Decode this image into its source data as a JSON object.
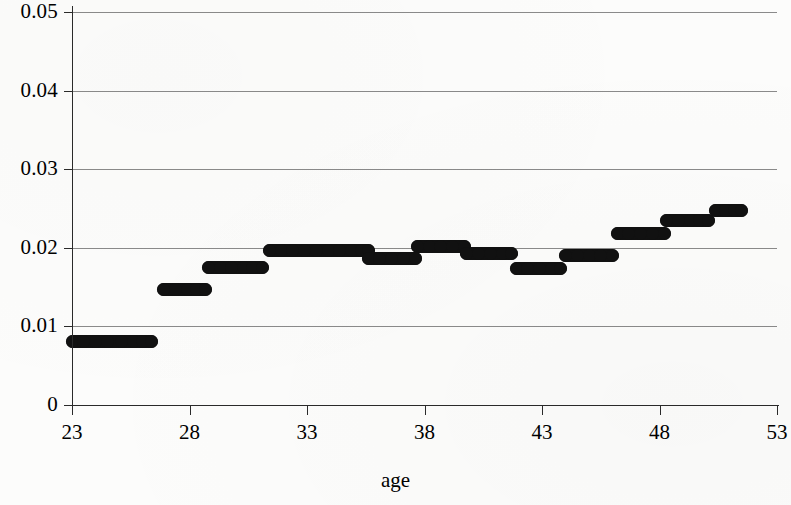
{
  "chart_data": {
    "type": "scatter",
    "title": "",
    "xlabel": "age",
    "ylabel": "",
    "xlim": [
      23,
      53
    ],
    "ylim": [
      0,
      0.05
    ],
    "grid": true,
    "legend": "none",
    "x_ticks": [
      "23",
      "28",
      "33",
      "38",
      "43",
      "48",
      "53"
    ],
    "x_tick_values": [
      23,
      28,
      33,
      38,
      43,
      48,
      53
    ],
    "y_ticks": [
      "0.05",
      "0.04",
      "0.03",
      "0.02",
      "0.01",
      "0"
    ],
    "y_tick_values": [
      0.05,
      0.04,
      0.03,
      0.02,
      0.01,
      0
    ],
    "steps": [
      {
        "x_start": 23.0,
        "x_end": 26.4,
        "value": 0.0081
      },
      {
        "x_start": 26.9,
        "x_end": 28.7,
        "value": 0.0147
      },
      {
        "x_start": 28.8,
        "x_end": 31.1,
        "value": 0.0175
      },
      {
        "x_start": 31.4,
        "x_end": 35.6,
        "value": 0.0197
      },
      {
        "x_start": 35.6,
        "x_end": 37.6,
        "value": 0.0187
      },
      {
        "x_start": 37.7,
        "x_end": 39.7,
        "value": 0.0202
      },
      {
        "x_start": 39.8,
        "x_end": 41.7,
        "value": 0.0193
      },
      {
        "x_start": 41.9,
        "x_end": 43.8,
        "value": 0.0174
      },
      {
        "x_start": 44.0,
        "x_end": 46.0,
        "value": 0.019
      },
      {
        "x_start": 46.2,
        "x_end": 48.2,
        "value": 0.0218
      },
      {
        "x_start": 48.3,
        "x_end": 50.1,
        "value": 0.0235
      },
      {
        "x_start": 50.4,
        "x_end": 51.5,
        "value": 0.0247
      }
    ],
    "points": [
      {
        "x": 23.0,
        "y": 0.0081
      },
      {
        "x": 23.5,
        "y": 0.0081
      },
      {
        "x": 24.0,
        "y": 0.0081
      },
      {
        "x": 24.5,
        "y": 0.0081
      },
      {
        "x": 25.1,
        "y": 0.0081
      },
      {
        "x": 25.6,
        "y": 0.0081
      },
      {
        "x": 26.0,
        "y": 0.0081
      },
      {
        "x": 26.4,
        "y": 0.0081
      },
      {
        "x": 26.9,
        "y": 0.0147
      },
      {
        "x": 27.4,
        "y": 0.0147
      },
      {
        "x": 27.9,
        "y": 0.0147
      },
      {
        "x": 28.3,
        "y": 0.0147
      },
      {
        "x": 28.7,
        "y": 0.0147
      },
      {
        "x": 28.8,
        "y": 0.0175
      },
      {
        "x": 29.3,
        "y": 0.0175
      },
      {
        "x": 29.8,
        "y": 0.0175
      },
      {
        "x": 30.3,
        "y": 0.0175
      },
      {
        "x": 30.7,
        "y": 0.0175
      },
      {
        "x": 31.1,
        "y": 0.0175
      },
      {
        "x": 31.4,
        "y": 0.0197
      },
      {
        "x": 31.9,
        "y": 0.0197
      },
      {
        "x": 32.4,
        "y": 0.0197
      },
      {
        "x": 32.9,
        "y": 0.0197
      },
      {
        "x": 33.4,
        "y": 0.0197
      },
      {
        "x": 33.9,
        "y": 0.0197
      },
      {
        "x": 34.4,
        "y": 0.0197
      },
      {
        "x": 34.9,
        "y": 0.0197
      },
      {
        "x": 35.3,
        "y": 0.0197
      },
      {
        "x": 35.6,
        "y": 0.0197
      },
      {
        "x": 35.6,
        "y": 0.0187
      },
      {
        "x": 36.1,
        "y": 0.0187
      },
      {
        "x": 36.6,
        "y": 0.0187
      },
      {
        "x": 37.1,
        "y": 0.0187
      },
      {
        "x": 37.6,
        "y": 0.0187
      },
      {
        "x": 37.7,
        "y": 0.0202
      },
      {
        "x": 38.2,
        "y": 0.0202
      },
      {
        "x": 38.7,
        "y": 0.0202
      },
      {
        "x": 39.2,
        "y": 0.0202
      },
      {
        "x": 39.7,
        "y": 0.0202
      },
      {
        "x": 39.8,
        "y": 0.0193
      },
      {
        "x": 40.3,
        "y": 0.0193
      },
      {
        "x": 40.8,
        "y": 0.0193
      },
      {
        "x": 41.3,
        "y": 0.0193
      },
      {
        "x": 41.7,
        "y": 0.0193
      },
      {
        "x": 41.9,
        "y": 0.0174
      },
      {
        "x": 42.4,
        "y": 0.0174
      },
      {
        "x": 42.9,
        "y": 0.0174
      },
      {
        "x": 43.4,
        "y": 0.0174
      },
      {
        "x": 43.8,
        "y": 0.0174
      },
      {
        "x": 44.0,
        "y": 0.019
      },
      {
        "x": 44.5,
        "y": 0.019
      },
      {
        "x": 45.0,
        "y": 0.019
      },
      {
        "x": 45.5,
        "y": 0.019
      },
      {
        "x": 46.0,
        "y": 0.019
      },
      {
        "x": 46.2,
        "y": 0.0218
      },
      {
        "x": 46.7,
        "y": 0.0218
      },
      {
        "x": 47.2,
        "y": 0.0218
      },
      {
        "x": 47.7,
        "y": 0.0218
      },
      {
        "x": 48.2,
        "y": 0.0218
      },
      {
        "x": 48.3,
        "y": 0.0235
      },
      {
        "x": 48.8,
        "y": 0.0235
      },
      {
        "x": 49.3,
        "y": 0.0235
      },
      {
        "x": 49.7,
        "y": 0.0235
      },
      {
        "x": 50.1,
        "y": 0.0235
      },
      {
        "x": 50.4,
        "y": 0.0247
      },
      {
        "x": 50.8,
        "y": 0.0247
      },
      {
        "x": 51.2,
        "y": 0.0247
      },
      {
        "x": 51.5,
        "y": 0.0247
      }
    ],
    "marker": {
      "shape": "circle",
      "color": "#111111",
      "size": 13
    }
  },
  "axes": {
    "x_title": "age"
  },
  "colors": {
    "marker": "#111111",
    "gridline": "#8a8a8a",
    "axis": "#2a2a2a",
    "background": "#fcfcfb"
  }
}
